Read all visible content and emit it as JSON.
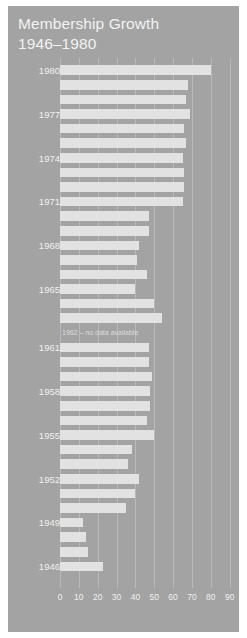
{
  "poster": {
    "background_color": "#a3a3a3",
    "title_line1": "Membership Growth",
    "title_line2": "1946–1980",
    "title_color": "#f2f2f2",
    "bar_color": "#e2e2e2",
    "gridline_color": "#b9b9b9"
  },
  "annotation": {
    "no_data_note": "1962 – no data available"
  },
  "axis": {
    "tick_labels": [
      "0",
      "10",
      "20",
      "30",
      "40",
      "50",
      "60",
      "70",
      "80",
      "90"
    ]
  },
  "chart_data": {
    "type": "bar",
    "orientation": "horizontal",
    "title": "Membership Growth 1946–1980",
    "xlabel": "",
    "ylabel": "",
    "xlim": [
      0,
      95
    ],
    "ylim": null,
    "grid": true,
    "legend": null,
    "xticks": [
      0,
      10,
      20,
      30,
      40,
      50,
      60,
      70,
      80,
      90
    ],
    "visible_y_tick_labels": [
      "1980",
      "1977",
      "1974",
      "1971",
      "1968",
      "1965",
      "1961",
      "1958",
      "1955",
      "1952",
      "1949",
      "1946"
    ],
    "y_label_interval_years": 3,
    "annotations": [
      {
        "category": "1962",
        "text": "1962 – no data available"
      }
    ],
    "categories": [
      "1980",
      "1979",
      "1978",
      "1977",
      "1976",
      "1975",
      "1974",
      "1973",
      "1972",
      "1971",
      "1970",
      "1969",
      "1968",
      "1967",
      "1966",
      "1965",
      "1964",
      "1963",
      "1962",
      "1961",
      "1960",
      "1959",
      "1958",
      "1957",
      "1956",
      "1955",
      "1954",
      "1953",
      "1952",
      "1951",
      "1950",
      "1949",
      "1948",
      "1947",
      "1946"
    ],
    "values": [
      80,
      68,
      67,
      69,
      66,
      67,
      65,
      66,
      66,
      65,
      47,
      47,
      42,
      41,
      46,
      40,
      50,
      54,
      null,
      47,
      47,
      49,
      48,
      48,
      46,
      50,
      38,
      36,
      42,
      40,
      35,
      12,
      14,
      15,
      23
    ],
    "series": [
      {
        "name": "Membership",
        "values": [
          80,
          68,
          67,
          69,
          66,
          67,
          65,
          66,
          66,
          65,
          47,
          47,
          42,
          41,
          46,
          40,
          50,
          54,
          null,
          47,
          47,
          49,
          48,
          48,
          46,
          50,
          38,
          36,
          42,
          40,
          35,
          12,
          14,
          15,
          23
        ]
      }
    ],
    "rows": [
      {
        "year": "1980",
        "label": "1980",
        "value": 80
      },
      {
        "year": "1979",
        "label": "",
        "value": 68
      },
      {
        "year": "1978",
        "label": "",
        "value": 67
      },
      {
        "year": "1977",
        "label": "1977",
        "value": 69
      },
      {
        "year": "1976",
        "label": "",
        "value": 66
      },
      {
        "year": "1975",
        "label": "",
        "value": 67
      },
      {
        "year": "1974",
        "label": "1974",
        "value": 65
      },
      {
        "year": "1973",
        "label": "",
        "value": 66
      },
      {
        "year": "1972",
        "label": "",
        "value": 66
      },
      {
        "year": "1971",
        "label": "1971",
        "value": 65
      },
      {
        "year": "1970",
        "label": "",
        "value": 47
      },
      {
        "year": "1969",
        "label": "",
        "value": 47
      },
      {
        "year": "1968",
        "label": "1968",
        "value": 42
      },
      {
        "year": "1967",
        "label": "",
        "value": 41
      },
      {
        "year": "1966",
        "label": "",
        "value": 46
      },
      {
        "year": "1965",
        "label": "1965",
        "value": 40
      },
      {
        "year": "1964",
        "label": "",
        "value": 50
      },
      {
        "year": "1963",
        "label": "",
        "value": 54
      },
      {
        "year": "1962",
        "label": "",
        "value": null
      },
      {
        "year": "1961",
        "label": "1961",
        "value": 47
      },
      {
        "year": "1960",
        "label": "",
        "value": 47
      },
      {
        "year": "1959",
        "label": "",
        "value": 49
      },
      {
        "year": "1958",
        "label": "1958",
        "value": 48
      },
      {
        "year": "1957",
        "label": "",
        "value": 48
      },
      {
        "year": "1956",
        "label": "",
        "value": 46
      },
      {
        "year": "1955",
        "label": "1955",
        "value": 50
      },
      {
        "year": "1954",
        "label": "",
        "value": 38
      },
      {
        "year": "1953",
        "label": "",
        "value": 36
      },
      {
        "year": "1952",
        "label": "1952",
        "value": 42
      },
      {
        "year": "1951",
        "label": "",
        "value": 40
      },
      {
        "year": "1950",
        "label": "",
        "value": 35
      },
      {
        "year": "1949",
        "label": "1949",
        "value": 12
      },
      {
        "year": "1948",
        "label": "",
        "value": 14
      },
      {
        "year": "1947",
        "label": "",
        "value": 15
      },
      {
        "year": "1946",
        "label": "1946",
        "value": 23
      }
    ]
  }
}
